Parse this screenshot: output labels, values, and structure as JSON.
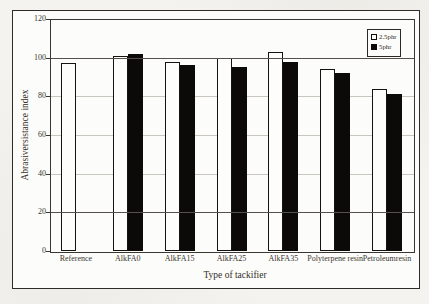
{
  "chart_data": {
    "type": "bar",
    "title": "",
    "xlabel": "Type of tackifier",
    "ylabel": "Abrasiversistance index",
    "ylim": [
      0,
      120
    ],
    "yticks": [
      0,
      20,
      40,
      60,
      80,
      100,
      120
    ],
    "categories": [
      "Reference",
      "AlkFA0",
      "AlkFA15",
      "AlkFA25",
      "AlkFA35",
      "Polyterpene resin",
      "Petroleumresin"
    ],
    "series": [
      {
        "name": "2.5phr",
        "style": "open",
        "color": "#ffffff",
        "values": [
          97,
          101,
          98,
          100,
          103,
          94,
          84
        ]
      },
      {
        "name": "5phr",
        "style": "solid",
        "color": "#0b0a08",
        "values": [
          null,
          102,
          96,
          95,
          98,
          92,
          81
        ]
      }
    ],
    "legend_position": "top-right",
    "grid": {
      "solid_lines": [
        20,
        100
      ],
      "solid_color": "#55514a",
      "faint_lines": [
        40,
        60,
        80
      ],
      "faint_color": "#c9c6bf"
    },
    "bar_outline_color": "#15130f",
    "frame_color": "#2e2c28"
  }
}
